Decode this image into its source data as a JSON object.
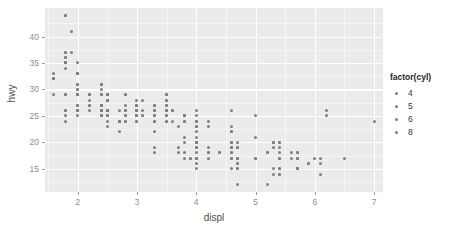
{
  "chart_data": {
    "type": "scatter",
    "title": "",
    "xlabel": "displ",
    "ylabel": "hwy",
    "xlim": [
      1.45,
      7.15
    ],
    "ylim": [
      10.6,
      45.4
    ],
    "xticks": [
      2,
      3,
      4,
      5,
      6,
      7
    ],
    "yticks": [
      15,
      20,
      25,
      30,
      35,
      40
    ],
    "xminor": [
      1.5,
      2.5,
      3.5,
      4.5,
      5.5,
      6.5
    ],
    "yminor": [
      12.5,
      17.5,
      22.5,
      27.5,
      32.5,
      37.5,
      42.5
    ],
    "grid": true,
    "legend": {
      "title": "factor(cyl)",
      "position": "right",
      "entries": [
        {
          "label": "4",
          "color": "#7f7f7f"
        },
        {
          "label": "5",
          "color": "#7f7f7f"
        },
        {
          "label": "6",
          "color": "#7f7f7f"
        },
        {
          "label": "8",
          "color": "#7f7f7f"
        }
      ]
    },
    "point_color": "#7f7f7f",
    "panel_background": "#ebebeb",
    "gridline_color": "#ffffff",
    "series": [
      {
        "name": "4",
        "cyl": 4,
        "color": "#7f7f7f",
        "points": [
          [
            1.8,
            29
          ],
          [
            1.8,
            29
          ],
          [
            2.0,
            31
          ],
          [
            2.0,
            30
          ],
          [
            1.8,
            26
          ],
          [
            1.8,
            26
          ],
          [
            2.0,
            27
          ],
          [
            2.0,
            26
          ],
          [
            2.8,
            26
          ],
          [
            1.8,
            25
          ],
          [
            1.8,
            24
          ],
          [
            2.0,
            27
          ],
          [
            2.0,
            25
          ],
          [
            2.4,
            25
          ],
          [
            2.4,
            26
          ],
          [
            2.5,
            23
          ],
          [
            2.5,
            24
          ],
          [
            3.3,
            24
          ],
          [
            2.4,
            27
          ],
          [
            2.4,
            26
          ],
          [
            2.5,
            25
          ],
          [
            2.5,
            26
          ],
          [
            3.5,
            28
          ],
          [
            2.0,
            26
          ],
          [
            2.0,
            26
          ],
          [
            2.4,
            26
          ],
          [
            2.4,
            27
          ],
          [
            2.5,
            29
          ],
          [
            2.5,
            29
          ],
          [
            2.2,
            26
          ],
          [
            2.2,
            27
          ],
          [
            2.4,
            26
          ],
          [
            2.4,
            25
          ],
          [
            3.0,
            26
          ],
          [
            3.0,
            25
          ],
          [
            1.6,
            33
          ],
          [
            1.6,
            32
          ],
          [
            1.6,
            32
          ],
          [
            1.6,
            29
          ],
          [
            1.6,
            32
          ],
          [
            1.8,
            34
          ],
          [
            1.8,
            36
          ],
          [
            1.8,
            36
          ],
          [
            2.0,
            29
          ],
          [
            2.4,
            26
          ],
          [
            2.4,
            27
          ],
          [
            2.4,
            30
          ],
          [
            2.4,
            31
          ],
          [
            2.5,
            26
          ],
          [
            2.5,
            26
          ],
          [
            3.3,
            22
          ],
          [
            2.0,
            29
          ],
          [
            2.0,
            29
          ],
          [
            2.0,
            29
          ],
          [
            2.0,
            29
          ],
          [
            2.7,
            24
          ],
          [
            2.7,
            24
          ],
          [
            2.7,
            22
          ],
          [
            3.0,
            26
          ],
          [
            2.2,
            29
          ],
          [
            2.2,
            29
          ],
          [
            2.4,
            29
          ],
          [
            2.4,
            29
          ],
          [
            3.0,
            26
          ],
          [
            3.0,
            26
          ],
          [
            3.5,
            26
          ],
          [
            2.2,
            28
          ],
          [
            2.2,
            29
          ],
          [
            2.4,
            31
          ],
          [
            2.4,
            31
          ],
          [
            3.0,
            27
          ],
          [
            3.0,
            26
          ],
          [
            3.3,
            27
          ],
          [
            1.8,
            44
          ],
          [
            1.8,
            44
          ],
          [
            1.9,
            41
          ],
          [
            2.0,
            29
          ],
          [
            2.0,
            26
          ],
          [
            2.5,
            28
          ],
          [
            2.5,
            29
          ],
          [
            1.8,
            35
          ],
          [
            1.8,
            35
          ],
          [
            2.0,
            33
          ],
          [
            2.0,
            33
          ],
          [
            2.8,
            24
          ],
          [
            2.8,
            24
          ],
          [
            3.6,
            26
          ],
          [
            2.5,
            26
          ],
          [
            2.5,
            26
          ],
          [
            2.5,
            26
          ],
          [
            2.5,
            26
          ],
          [
            2.5,
            25
          ],
          [
            2.5,
            25
          ],
          [
            1.8,
            35
          ],
          [
            1.8,
            35
          ],
          [
            1.8,
            37
          ],
          [
            1.8,
            35
          ],
          [
            1.8,
            37
          ],
          [
            2.0,
            33
          ],
          [
            2.0,
            35
          ],
          [
            2.8,
            29
          ],
          [
            2.8,
            29
          ],
          [
            1.9,
            37
          ],
          [
            2.0,
            31
          ],
          [
            2.0,
            30
          ],
          [
            2.5,
            28
          ],
          [
            2.5,
            28
          ],
          [
            2.2,
            27
          ]
        ]
      },
      {
        "name": "5",
        "cyl": 5,
        "color": "#7f7f7f",
        "points": [
          [
            2.5,
            29
          ],
          [
            2.5,
            29
          ],
          [
            2.5,
            28
          ],
          [
            2.5,
            29
          ]
        ]
      },
      {
        "name": "6",
        "cyl": 6,
        "color": "#7f7f7f",
        "points": [
          [
            2.8,
            26
          ],
          [
            2.8,
            25
          ],
          [
            3.1,
            25
          ],
          [
            2.8,
            25
          ],
          [
            3.1,
            25
          ],
          [
            4.2,
            23
          ],
          [
            3.0,
            24
          ],
          [
            3.7,
            19
          ],
          [
            3.7,
            18
          ],
          [
            3.9,
            17
          ],
          [
            3.9,
            17
          ],
          [
            4.7,
            19
          ],
          [
            4.0,
            17
          ],
          [
            4.0,
            19
          ],
          [
            4.0,
            19
          ],
          [
            4.6,
            19
          ],
          [
            5.0,
            17
          ],
          [
            4.2,
            17
          ],
          [
            3.8,
            17
          ],
          [
            3.8,
            18
          ],
          [
            4.0,
            17
          ],
          [
            3.5,
            29
          ],
          [
            3.5,
            29
          ],
          [
            3.5,
            28
          ],
          [
            3.5,
            29
          ],
          [
            4.0,
            24
          ],
          [
            4.0,
            24
          ],
          [
            4.0,
            22
          ],
          [
            4.6,
            22
          ],
          [
            5.0,
            21
          ],
          [
            2.4,
            27
          ],
          [
            3.0,
            26
          ],
          [
            3.5,
            25
          ],
          [
            3.5,
            25
          ],
          [
            3.0,
            28
          ],
          [
            3.3,
            27
          ],
          [
            3.3,
            25
          ],
          [
            4.0,
            25
          ],
          [
            5.6,
            18
          ],
          [
            3.1,
            26
          ],
          [
            3.8,
            25
          ],
          [
            3.8,
            24
          ],
          [
            3.8,
            24
          ],
          [
            5.3,
            20
          ],
          [
            2.7,
            24
          ],
          [
            2.7,
            24
          ],
          [
            3.0,
            26
          ],
          [
            3.7,
            23
          ],
          [
            4.0,
            20
          ],
          [
            4.7,
            15
          ],
          [
            4.7,
            15
          ],
          [
            4.7,
            16
          ],
          [
            5.7,
            17
          ],
          [
            6.1,
            17
          ],
          [
            4.0,
            26
          ],
          [
            4.0,
            23
          ],
          [
            4.6,
            26
          ],
          [
            5.0,
            25
          ],
          [
            4.2,
            24
          ],
          [
            4.2,
            19
          ],
          [
            4.6,
            18
          ],
          [
            4.6,
            20
          ],
          [
            4.6,
            20
          ],
          [
            5.4,
            20
          ],
          [
            3.8,
            20
          ],
          [
            3.8,
            21
          ],
          [
            4.0,
            21
          ],
          [
            4.0,
            20
          ],
          [
            4.6,
            17
          ],
          [
            5.4,
            17
          ],
          [
            3.3,
            19
          ],
          [
            3.3,
            18
          ],
          [
            4.0,
            18
          ],
          [
            5.6,
            17
          ],
          [
            3.1,
            28
          ],
          [
            3.8,
            25
          ],
          [
            3.8,
            25
          ],
          [
            3.8,
            25
          ],
          [
            4.0,
            24
          ],
          [
            4.0,
            23
          ],
          [
            4.6,
            22
          ],
          [
            3.0,
            27
          ],
          [
            3.0,
            25
          ],
          [
            3.5,
            24
          ],
          [
            3.5,
            24
          ],
          [
            3.0,
            26
          ],
          [
            3.0,
            25
          ],
          [
            3.3,
            26
          ],
          [
            3.3,
            25
          ],
          [
            2.7,
            26
          ],
          [
            2.7,
            24
          ],
          [
            3.0,
            27
          ],
          [
            3.5,
            26
          ],
          [
            3.6,
            24
          ],
          [
            2.4,
            25
          ],
          [
            3.0,
            24
          ],
          [
            3.5,
            27
          ],
          [
            3.5,
            27
          ],
          [
            3.5,
            26
          ],
          [
            3.0,
            26
          ],
          [
            3.0,
            25
          ],
          [
            3.3,
            26
          ],
          [
            3.3,
            24
          ],
          [
            2.8,
            27
          ],
          [
            3.6,
            26
          ]
        ]
      },
      {
        "name": "8",
        "cyl": 8,
        "color": "#7f7f7f",
        "points": [
          [
            5.3,
            20
          ],
          [
            5.3,
            15
          ],
          [
            5.3,
            20
          ],
          [
            5.7,
            17
          ],
          [
            6.0,
            17
          ],
          [
            5.7,
            15
          ],
          [
            5.7,
            17
          ],
          [
            6.2,
            26
          ],
          [
            6.2,
            25
          ],
          [
            7.0,
            24
          ],
          [
            5.3,
            19
          ],
          [
            5.3,
            14
          ],
          [
            5.7,
            15
          ],
          [
            6.5,
            17
          ],
          [
            5.2,
            18
          ],
          [
            5.2,
            18
          ],
          [
            5.7,
            15
          ],
          [
            5.9,
            16
          ],
          [
            4.7,
            12
          ],
          [
            4.7,
            17
          ],
          [
            4.7,
            16
          ],
          [
            5.2,
            12
          ],
          [
            5.7,
            15
          ],
          [
            5.9,
            16
          ],
          [
            4.6,
            15
          ],
          [
            5.4,
            15
          ],
          [
            5.4,
            14
          ],
          [
            4.0,
            15
          ],
          [
            4.2,
            18
          ],
          [
            4.4,
            18
          ],
          [
            4.6,
            19
          ],
          [
            5.4,
            15
          ],
          [
            5.4,
            14
          ],
          [
            4.6,
            23
          ],
          [
            5.4,
            17
          ],
          [
            5.4,
            19
          ],
          [
            4.0,
            16
          ],
          [
            4.0,
            17
          ],
          [
            4.6,
            17
          ],
          [
            5.0,
            17
          ],
          [
            4.6,
            20
          ],
          [
            4.6,
            18
          ],
          [
            5.4,
            18
          ],
          [
            5.4,
            20
          ],
          [
            4.7,
            17
          ],
          [
            5.7,
            18
          ],
          [
            5.7,
            18
          ],
          [
            6.1,
            16
          ],
          [
            4.0,
            20
          ],
          [
            4.7,
            19
          ],
          [
            4.7,
            17
          ],
          [
            4.7,
            20
          ],
          [
            5.7,
            17
          ],
          [
            6.1,
            14
          ],
          [
            4.0,
            20
          ],
          [
            4.2,
            18
          ],
          [
            4.4,
            18
          ],
          [
            4.6,
            19
          ]
        ]
      }
    ]
  },
  "axis": {
    "x_title": "displ",
    "y_title": "hwy",
    "x_tick_labels": [
      "2",
      "3",
      "4",
      "5",
      "6",
      "7"
    ],
    "y_tick_labels": [
      "15",
      "20",
      "25",
      "30",
      "35",
      "40"
    ]
  },
  "legend": {
    "title": "factor(cyl)",
    "items": [
      {
        "label": "4"
      },
      {
        "label": "5"
      },
      {
        "label": "6"
      },
      {
        "label": "8"
      }
    ]
  }
}
